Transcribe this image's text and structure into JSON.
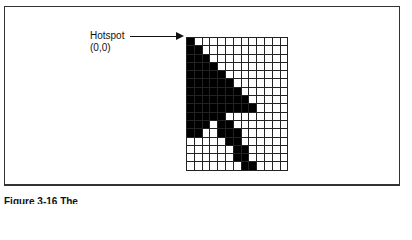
{
  "figure": {
    "hotspot_label": "Hotspot",
    "hotspot_coords": "(0,0)",
    "caption": "Figure 3-16  The"
  },
  "grid": {
    "cols": 13,
    "rows": 16,
    "bitmap": [
      "1000000000000",
      "1100000000000",
      "1110000000000",
      "1111000000000",
      "1111100000000",
      "1111110000000",
      "1111111000000",
      "1111111100000",
      "1111111110000",
      "1111100000000",
      "1110110000000",
      "1100111000000",
      "0000011000000",
      "0000001100000",
      "0000001100000",
      "0000000110000"
    ]
  }
}
